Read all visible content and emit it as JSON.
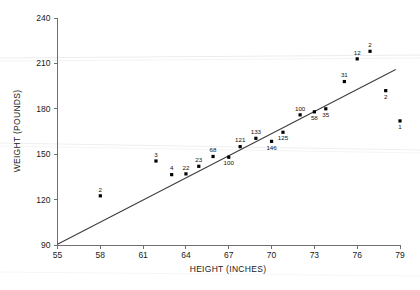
{
  "chart_data": {
    "type": "scatter",
    "title": "",
    "xlabel": "HEIGHT (INCHES)",
    "ylabel": "WEIGHT (POUNDS)",
    "xlim": [
      55,
      79
    ],
    "ylim": [
      90,
      240
    ],
    "xticks": [
      55,
      58,
      61,
      64,
      67,
      70,
      73,
      76,
      79
    ],
    "yticks": [
      90,
      120,
      150,
      180,
      210,
      240
    ],
    "grid": false,
    "legend": null,
    "point_label_field": "count",
    "points": [
      {
        "x": 58.0,
        "y": 122.5,
        "label": "2",
        "label_pos": "above"
      },
      {
        "x": 61.9,
        "y": 145.5,
        "label": "3",
        "label_pos": "above"
      },
      {
        "x": 63.0,
        "y": 136.5,
        "label": "4",
        "label_pos": "above"
      },
      {
        "x": 64.0,
        "y": 137.0,
        "label": "22",
        "label_pos": "above"
      },
      {
        "x": 64.9,
        "y": 142.0,
        "label": "23",
        "label_pos": "above"
      },
      {
        "x": 65.9,
        "y": 148.5,
        "label": "68",
        "label_pos": "above"
      },
      {
        "x": 67.0,
        "y": 148.0,
        "label": "100",
        "label_pos": "below"
      },
      {
        "x": 67.8,
        "y": 155.0,
        "label": "121",
        "label_pos": "above"
      },
      {
        "x": 68.9,
        "y": 160.5,
        "label": "133",
        "label_pos": "above"
      },
      {
        "x": 70.0,
        "y": 158.5,
        "label": "146",
        "label_pos": "below"
      },
      {
        "x": 70.8,
        "y": 164.5,
        "label": "125",
        "label_pos": "below"
      },
      {
        "x": 72.0,
        "y": 176.0,
        "label": "100",
        "label_pos": "above"
      },
      {
        "x": 73.0,
        "y": 178.0,
        "label": "58",
        "label_pos": "below"
      },
      {
        "x": 73.8,
        "y": 180.0,
        "label": "35",
        "label_pos": "below"
      },
      {
        "x": 75.1,
        "y": 198.0,
        "label": "31",
        "label_pos": "above"
      },
      {
        "x": 76.0,
        "y": 213.0,
        "label": "12",
        "label_pos": "above"
      },
      {
        "x": 76.9,
        "y": 218.0,
        "label": "2",
        "label_pos": "above"
      },
      {
        "x": 78.0,
        "y": 192.0,
        "label": "2",
        "label_pos": "below"
      },
      {
        "x": 79.0,
        "y": 172.0,
        "label": "1",
        "label_pos": "below"
      }
    ],
    "fit_line": {
      "name": "least-squares regression line",
      "x_start": 55.0,
      "y_start": 90.5,
      "x_end": 78.7,
      "y_end": 206.0
    }
  }
}
